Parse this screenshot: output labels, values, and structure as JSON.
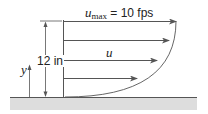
{
  "diagram": {
    "labels": {
      "umax_symbol": "u",
      "umax_subscript": "max",
      "umax_value": " = 10 fps",
      "height": "12 in",
      "velocity": "u",
      "y_axis": "y"
    },
    "arrows": [
      {
        "y": 21,
        "x_end": 176
      },
      {
        "y": 40,
        "x_end": 169
      },
      {
        "y": 60,
        "x_end": 157
      },
      {
        "y": 78,
        "x_end": 137
      }
    ],
    "colors": {
      "line": "#555555",
      "ground": "#dddddd",
      "text": "#222222"
    }
  }
}
